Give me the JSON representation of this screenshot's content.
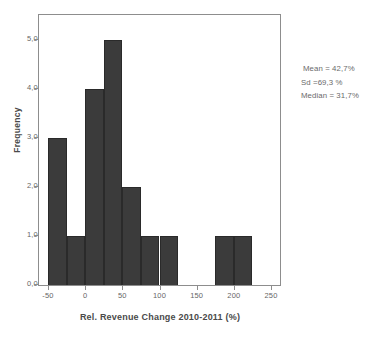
{
  "chart_data": {
    "type": "bar",
    "subtype": "histogram",
    "title": "",
    "xlabel": "Rel. Revenue Change 2010-2011 (%)",
    "ylabel": "Frequency",
    "xlim": [
      -62,
      262
    ],
    "ylim": [
      0,
      5.5
    ],
    "bin_width": 25,
    "grid": false,
    "legend": null,
    "bar_color": "#3b3b3b",
    "frame_color": "#8d8d8d",
    "x_tick_labels": [
      "-50",
      "0",
      "50",
      "100",
      "150",
      "200",
      "250"
    ],
    "x_tick_values": [
      -50,
      0,
      50,
      100,
      150,
      200,
      250
    ],
    "y_tick_labels": [
      "0,0",
      "1,0",
      "2,0",
      "3,0",
      "4,0",
      "5,0"
    ],
    "y_tick_values": [
      0,
      1,
      2,
      3,
      4,
      5
    ],
    "bins": [
      {
        "left": -50,
        "right": -25,
        "value": 3
      },
      {
        "left": -25,
        "right": 0,
        "value": 1
      },
      {
        "left": 0,
        "right": 25,
        "value": 4
      },
      {
        "left": 25,
        "right": 50,
        "value": 5
      },
      {
        "left": 50,
        "right": 75,
        "value": 2
      },
      {
        "left": 75,
        "right": 100,
        "value": 1
      },
      {
        "left": 100,
        "right": 125,
        "value": 1
      },
      {
        "left": 125,
        "right": 150,
        "value": 0
      },
      {
        "left": 150,
        "right": 175,
        "value": 0
      },
      {
        "left": 175,
        "right": 200,
        "value": 1
      },
      {
        "left": 200,
        "right": 225,
        "value": 1
      }
    ],
    "categories": [
      "-50 to -25",
      "-25 to 0",
      "0 to 25",
      "25 to 50",
      "50 to 75",
      "75 to 100",
      "100 to 125",
      "125 to 150",
      "150 to 175",
      "175 to 200",
      "200 to 225"
    ],
    "values": [
      3,
      1,
      4,
      5,
      2,
      1,
      1,
      0,
      0,
      1,
      1
    ],
    "annotations": [
      "Mean = 42,7%",
      "Sd =69,3 %",
      "Median = 31,7%"
    ]
  },
  "stats": {
    "mean": "Mean = 42,7%",
    "sd": "Sd =69,3 %",
    "median": "Median = 31,7%"
  }
}
